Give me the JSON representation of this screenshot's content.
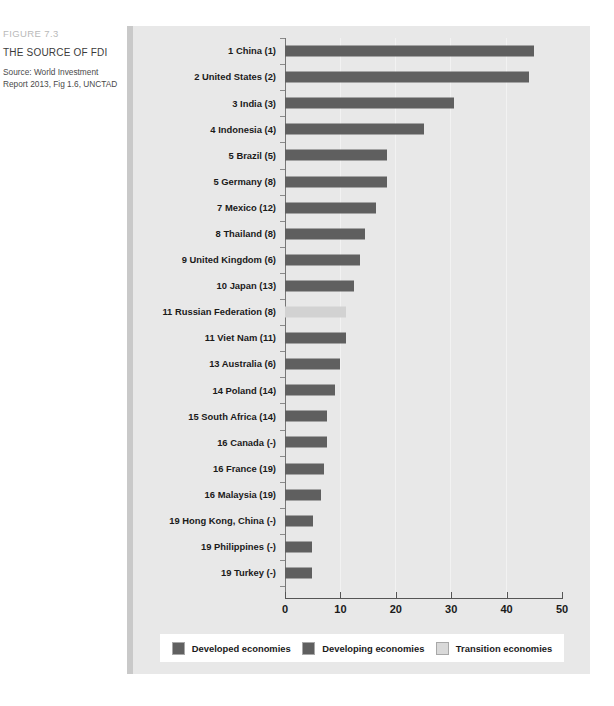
{
  "figure": {
    "number": "FIGURE 7.3",
    "title": "THE SOURCE OF FDI",
    "source_line1": "Source: World Investment",
    "source_line2": "Report 2013, Fig 1.6, UNCTAD"
  },
  "colors": {
    "developed": "#606060",
    "developing": "#5f5f5f",
    "transition": "#d9d9d9",
    "panel_bg": "#e8e8e8",
    "page_bg": "#ffffff"
  },
  "legend": {
    "position": "bottom",
    "items": [
      {
        "label": "Developed economies",
        "key": "developed"
      },
      {
        "label": "Developing economies",
        "key": "developing"
      },
      {
        "label": "Transition economies",
        "key": "transition"
      }
    ]
  },
  "chart_data": {
    "type": "bar",
    "orientation": "horizontal",
    "title": "THE SOURCE OF FDI",
    "subtitle": "FIGURE 7.3",
    "xlabel": "",
    "ylabel": "",
    "xlim": [
      0,
      50
    ],
    "xticks": [
      0,
      10,
      20,
      30,
      40,
      50
    ],
    "xticklabels": [
      "0",
      "10",
      "20",
      "30",
      "40",
      "50"
    ],
    "grid": "faint-vertical",
    "legend_position": "bottom",
    "categories": [
      "1 China (1)",
      "2 United States (2)",
      "3 India (3)",
      "4 Indonesia (4)",
      "5 Brazil (5)",
      "5 Germany (8)",
      "7 Mexico (12)",
      "8 Thailand (8)",
      "9 United Kingdom (6)",
      "10 Japan (13)",
      "11 Russian Federation (8)",
      "11 Viet Nam (11)",
      "13 Australia (6)",
      "14 Poland (14)",
      "15 South Africa (14)",
      "16 Canada (-)",
      "16 France (19)",
      "16 Malaysia (19)",
      "19 Hong Kong, China (-)",
      "19 Philippines (-)",
      "19 Turkey (-)"
    ],
    "values": [
      45,
      44,
      30.5,
      25,
      18.5,
      18.5,
      16.5,
      14.5,
      13.5,
      12.5,
      11,
      11,
      10,
      9,
      7.5,
      7.5,
      7,
      6.5,
      5,
      4.8,
      4.8
    ],
    "groups": [
      "developing",
      "developed",
      "developing",
      "developing",
      "developing",
      "developed",
      "developing",
      "developing",
      "developed",
      "developed",
      "transition",
      "developing",
      "developed",
      "developed",
      "developing",
      "developed",
      "developed",
      "developing",
      "developing",
      "developing",
      "developing"
    ]
  }
}
